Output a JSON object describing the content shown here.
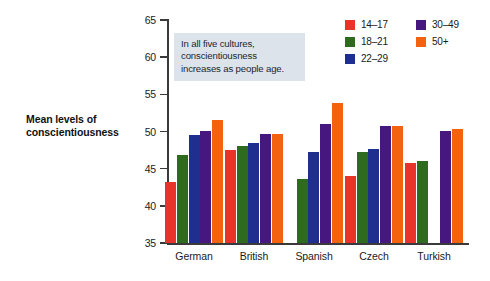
{
  "chart_data": {
    "type": "bar",
    "title": "",
    "xlabel": "",
    "ylabel": "Mean levels of conscientiousness",
    "ylim": [
      35,
      65
    ],
    "ytick_step": 5,
    "yticks": [
      65,
      60,
      55,
      50,
      45,
      40,
      35
    ],
    "grid": false,
    "legend_position": "top-right",
    "categories": [
      "German",
      "British",
      "Spanish",
      "Czech",
      "Turkish"
    ],
    "series": [
      {
        "name": "14–17",
        "color": "#e8332a",
        "values": [
          43.2,
          47.5,
          null,
          44.0,
          45.8
        ]
      },
      {
        "name": "18–21",
        "color": "#2f6b1e",
        "values": [
          46.9,
          48.0,
          43.6,
          47.3,
          46.1
        ]
      },
      {
        "name": "22–29",
        "color": "#1f2f8f",
        "values": [
          49.5,
          48.4,
          47.2,
          47.6,
          null
        ]
      },
      {
        "name": "30–49",
        "color": "#46177e",
        "values": [
          50.1,
          49.7,
          51.0,
          50.8,
          50.1
        ]
      },
      {
        "name": "50+",
        "color": "#f2620f",
        "values": [
          51.6,
          49.6,
          53.9,
          50.8,
          50.3
        ]
      }
    ],
    "annotation": {
      "lines": [
        "In all five cultures,",
        "conscientiousness",
        "increases as people age."
      ],
      "background": "#dde3ea"
    }
  },
  "axis": {
    "y_label_line1": "Mean levels of",
    "y_label_line2": "conscientiousness",
    "tick_labels": [
      "65",
      "60",
      "55",
      "50",
      "45",
      "40",
      "35"
    ]
  },
  "legend": {
    "column_a": [
      {
        "label": "14–17",
        "color": "#e8332a",
        "icon": "legend-swatch-red"
      },
      {
        "label": "18–21",
        "color": "#2f6b1e",
        "icon": "legend-swatch-green"
      },
      {
        "label": "22–29",
        "color": "#1f2f8f",
        "icon": "legend-swatch-blue"
      }
    ],
    "column_b": [
      {
        "label": "30–49",
        "color": "#46177e",
        "icon": "legend-swatch-purple"
      },
      {
        "label": "50+",
        "color": "#f2620f",
        "icon": "legend-swatch-orange"
      }
    ]
  },
  "colors": {
    "axis": "#3a3a3a",
    "text": "#1a1a1a",
    "background": "#ffffff",
    "annotation_bg": "#dde3ea"
  }
}
